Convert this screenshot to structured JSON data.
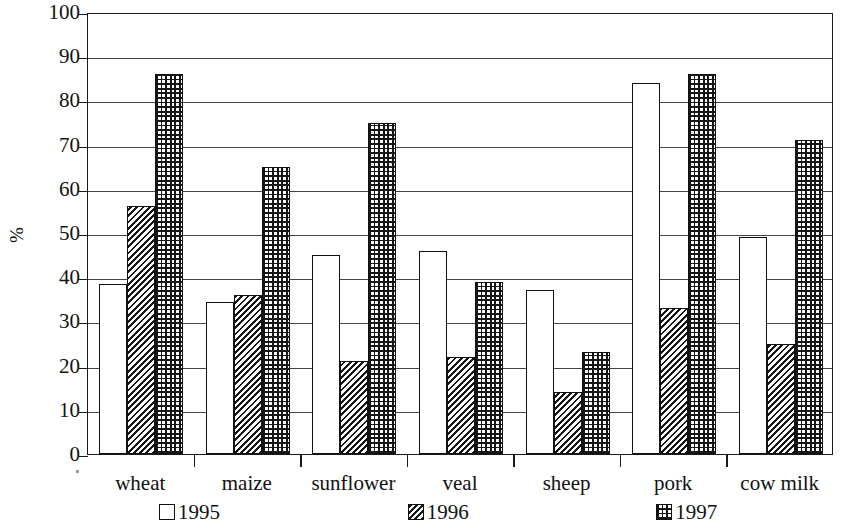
{
  "chart_data": {
    "type": "bar",
    "title": "",
    "xlabel": "",
    "ylabel": "%",
    "ylim": [
      0,
      100
    ],
    "ytick_step": 10,
    "yticks": [
      100,
      90,
      80,
      70,
      60,
      50,
      40,
      30,
      20,
      10,
      0
    ],
    "grid": true,
    "legend_position": "bottom",
    "categories": [
      "wheat",
      "maize",
      "sunflower",
      "veal",
      "sheep",
      "pork",
      "cow milk"
    ],
    "series": [
      {
        "name": "1995",
        "pattern": "blank",
        "values": [
          38.5,
          34.5,
          45,
          46,
          37,
          84,
          49
        ]
      },
      {
        "name": "1996",
        "pattern": "diagonal-hatch",
        "values": [
          56,
          36,
          21,
          22,
          14,
          33,
          25
        ]
      },
      {
        "name": "1997",
        "pattern": "grid-crosshatch",
        "values": [
          86,
          65,
          75,
          39,
          23,
          86,
          71
        ]
      }
    ],
    "colors": {
      "axis": "#1a1a1a",
      "gridline": "#444444",
      "bar_outline": "#111111",
      "bar_fill": "#ffffff",
      "hatch": "#161616",
      "background": "#ffffff"
    }
  },
  "legend": {
    "entries": [
      {
        "label": "1995",
        "pattern": "blank"
      },
      {
        "label": "1996",
        "pattern": "diagonal-hatch"
      },
      {
        "label": "1997",
        "pattern": "grid-crosshatch"
      }
    ]
  }
}
